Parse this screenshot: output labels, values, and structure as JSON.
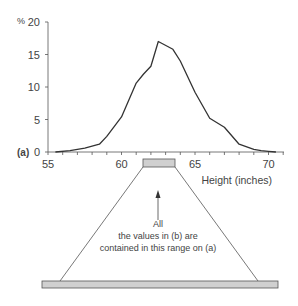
{
  "chart_data": {
    "type": "line",
    "panel_label": "(a)",
    "xlabel": "Height (inches)",
    "ylabel": "%",
    "x_ticks": [
      55,
      60,
      65,
      70
    ],
    "y_ticks": [
      0,
      5,
      10,
      15,
      20
    ],
    "xlim": [
      55,
      71
    ],
    "ylim": [
      0,
      20
    ],
    "grid": false,
    "x": [
      55.5,
      56.5,
      57.5,
      58.5,
      59,
      60,
      61,
      61.5,
      62,
      62.5,
      63.5,
      64,
      65,
      66,
      67,
      68,
      69,
      69.5,
      70,
      70.5
    ],
    "values": [
      0,
      0.2,
      0.6,
      1.2,
      2.4,
      5.4,
      10.6,
      12,
      13.2,
      17,
      15.8,
      14,
      9.2,
      5.2,
      3.8,
      1.2,
      0.4,
      0.2,
      0.1,
      0
    ],
    "highlight_range": [
      61.5,
      63.5
    ]
  },
  "annotation": {
    "line1": "All",
    "line2": "the values in (b) are",
    "line3": "contained in this range on (a)"
  },
  "labels": {
    "panel": "(a)",
    "y_unit": "%",
    "x_axis": "Height (inches)",
    "y_tick_0": "0",
    "y_tick_5": "5",
    "y_tick_10": "10",
    "y_tick_15": "15",
    "y_tick_20": "20",
    "x_tick_55": "55",
    "x_tick_60": "60",
    "x_tick_65": "65",
    "x_tick_70": "70"
  }
}
